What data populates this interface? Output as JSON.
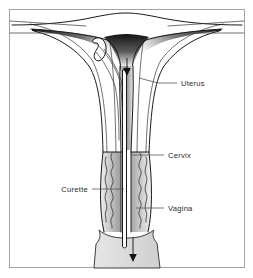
{
  "figure": {
    "background_color": "#ffffff",
    "frame_color": "#9a9a9a",
    "line_color": "#1a1a1a",
    "leader_color": "#555555",
    "label_color": "#2b2b2b",
    "shade_dark_color": "#1c1c1c",
    "shade_light_color": "#d8d8d8"
  },
  "labels": [
    {
      "id": "uterus",
      "text": "Uterus",
      "side": "right",
      "text_x": 180,
      "text_y": 86,
      "leader_from_x": 139,
      "leader_from_y": 78,
      "leader_mid_x": 160,
      "leader_to_x": 176,
      "leader_to_y": 83
    },
    {
      "id": "cervix",
      "text": "Cervix",
      "side": "right",
      "text_x": 168,
      "text_y": 159,
      "leader_from_x": 131,
      "leader_from_y": 155,
      "leader_to_x": 164,
      "leader_to_y": 155
    },
    {
      "id": "curette",
      "text": "Curette",
      "side": "left",
      "text_x": 56,
      "text_y": 192,
      "leader_from_x": 124,
      "leader_from_y": 189,
      "leader_to_x": 92,
      "leader_to_y": 189
    },
    {
      "id": "vagina",
      "text": "Vagina",
      "side": "right",
      "text_x": 168,
      "text_y": 212,
      "leader_from_x": 136,
      "leader_from_y": 208,
      "leader_to_x": 164,
      "leader_to_y": 208
    }
  ],
  "anatomy_parts": [
    {
      "id": "uterine-fundus",
      "name": "Uterine fundus"
    },
    {
      "id": "uterine-cavity",
      "name": "Uterine cavity"
    },
    {
      "id": "broad-ligament",
      "name": "Broad ligament"
    },
    {
      "id": "uterine-body",
      "name": "Uterine body"
    },
    {
      "id": "cervical-canal",
      "name": "Cervical canal"
    },
    {
      "id": "vaginal-wall-left",
      "name": "Left vaginal wall"
    },
    {
      "id": "vaginal-wall-right",
      "name": "Right vaginal wall"
    },
    {
      "id": "vaginal-introitus",
      "name": "Vaginal introitus"
    }
  ],
  "instrument": {
    "id": "curette",
    "name": "Curette",
    "tip_shape": "curved-loop",
    "shaft_orientation": "vertical"
  },
  "arrows": [
    {
      "id": "cavity-arrow",
      "direction": "down",
      "location": "uterine cavity"
    },
    {
      "id": "outflow-arrow",
      "direction": "down",
      "location": "vaginal introitus"
    }
  ]
}
